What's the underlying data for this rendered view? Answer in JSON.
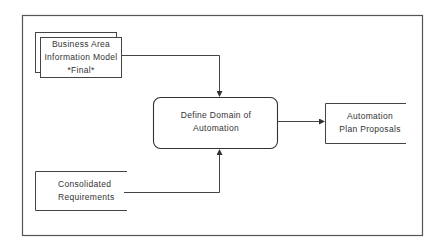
{
  "diagram": {
    "type": "process-flow",
    "colors": {
      "line": "#444444",
      "text": "#333333",
      "background": "#ffffff"
    },
    "nodes": [
      {
        "id": "business-area-model",
        "shape": "stacked-document",
        "lines": [
          "Business Area",
          "Information Model",
          "*Final*"
        ]
      },
      {
        "id": "consolidated-requirements",
        "shape": "open-store",
        "lines": [
          "Consolidated",
          "Requirements"
        ]
      },
      {
        "id": "define-domain",
        "shape": "rounded-process",
        "lines": [
          "Define Domain of",
          "Automation"
        ]
      },
      {
        "id": "automation-plan",
        "shape": "open-store",
        "lines": [
          "Automation",
          "Plan Proposals"
        ]
      }
    ],
    "edges": [
      {
        "from": "business-area-model",
        "to": "define-domain"
      },
      {
        "from": "consolidated-requirements",
        "to": "define-domain"
      },
      {
        "from": "define-domain",
        "to": "automation-plan"
      }
    ]
  }
}
